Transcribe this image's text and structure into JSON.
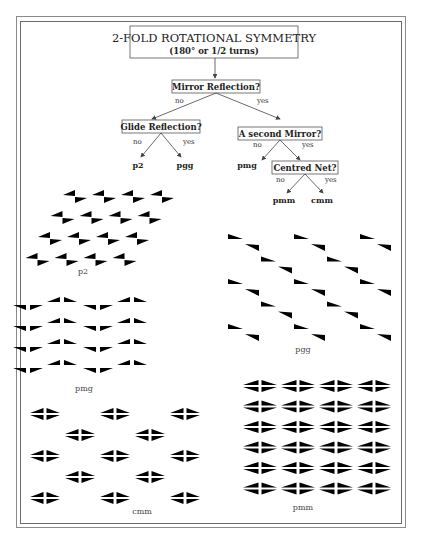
{
  "title": {
    "line1": "2-FOLD ROTATIONAL SYMMETRY",
    "line2": "(180° or 1/2 turns)"
  },
  "tree": {
    "q1": "Mirror Reflection?",
    "q1_no": "no",
    "q1_yes": "yes",
    "q2": "Glide Reflection?",
    "q2_no": "no",
    "q2_yes": "yes",
    "q3": "A second Mirror?",
    "q3_no": "no",
    "q3_yes": "yes",
    "q4": "Centred Net?",
    "q4_no": "no",
    "q4_yes": "yes",
    "leaves": {
      "p2": "p2",
      "pgg": "pgg",
      "pmg": "pmg",
      "pmm": "pmm",
      "cmm": "cmm"
    }
  },
  "patterns": {
    "p2": {
      "label": "p2"
    },
    "pgg": {
      "label": "pgg"
    },
    "pmg": {
      "label": "pmg"
    },
    "cmm": {
      "label": "cmm"
    },
    "pmm": {
      "label": "pmm"
    }
  }
}
